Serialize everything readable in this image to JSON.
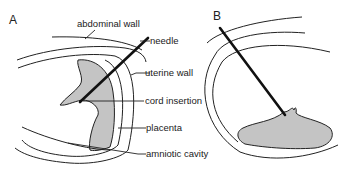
{
  "figure": {
    "panels": [
      {
        "id": "A",
        "label": "A",
        "labels": {
          "abdominal_wall": "abdominal  wall",
          "needle": "needle",
          "uterine_wall": "uterine  wall",
          "cord_insertion": "cord  insertion",
          "placenta": "placenta",
          "amniotic_cavity": "amniotic  cavity"
        }
      },
      {
        "id": "B",
        "label": "B"
      }
    ],
    "colors": {
      "placenta_fill": "#c4c4c4",
      "line": "#222222"
    }
  }
}
